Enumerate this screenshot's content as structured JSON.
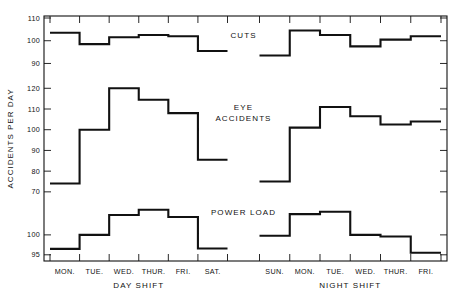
{
  "chart_data": {
    "type": "line",
    "title": "",
    "subtitle": "",
    "xlabel": "",
    "ylabel": "ACCIDENTS PER DAY",
    "grid": false,
    "legend_position": "inline-annotation",
    "panel_groups": [
      {
        "name": "DAY SHIFT",
        "categories": [
          "MON.",
          "TUE.",
          "WED.",
          "THUR.",
          "FRI.",
          "SAT."
        ]
      },
      {
        "name": "NIGHT SHIFT",
        "categories": [
          "SUN.",
          "MON.",
          "TUE.",
          "WED.",
          "THUR.",
          "FRI."
        ]
      }
    ],
    "panels": [
      {
        "name": "CUTS",
        "label": "CUTS",
        "ylim": [
          88,
          110
        ],
        "yticks": [
          90,
          100,
          110
        ],
        "ytick_labels": [
          "90",
          "100",
          "110"
        ],
        "series": [
          {
            "name": "DAY SHIFT",
            "categories": [
              "MON.",
              "TUE.",
              "WED.",
              "THUR.",
              "FRI.",
              "SAT."
            ],
            "values": [
              103.5,
              98.5,
              101.5,
              102.5,
              102.0,
              95.5
            ]
          },
          {
            "name": "NIGHT SHIFT",
            "categories": [
              "SUN.",
              "MON.",
              "TUE.",
              "WED.",
              "THUR.",
              "FRI."
            ],
            "values": [
              93.5,
              104.5,
              102.5,
              97.5,
              100.5,
              102.0
            ]
          }
        ]
      },
      {
        "name": "EYE ACCIDENTS",
        "label": "EYE\nACCIDENTS",
        "label_line1": "EYE",
        "label_line2": "ACCIDENTS",
        "ylim": [
          68,
          124
        ],
        "yticks": [
          70,
          80,
          90,
          100,
          110,
          120
        ],
        "ytick_labels": [
          "70",
          "80",
          "90",
          "100",
          "110",
          "120"
        ],
        "series": [
          {
            "name": "DAY SHIFT",
            "categories": [
              "MON.",
              "TUE.",
              "WED.",
              "THUR.",
              "FRI.",
              "SAT."
            ],
            "values": [
              74.0,
              100.0,
              120.0,
              114.5,
              108.0,
              85.5
            ]
          },
          {
            "name": "NIGHT SHIFT",
            "categories": [
              "SUN.",
              "MON.",
              "TUE.",
              "WED.",
              "THUR.",
              "FRI."
            ],
            "values": [
              75.0,
              101.0,
              111.0,
              106.5,
              102.5,
              104.0
            ]
          }
        ]
      },
      {
        "name": "POWER LOAD",
        "label": "POWER LOAD",
        "ylim": [
          94.2,
          107.5
        ],
        "yticks": [
          95,
          100
        ],
        "ytick_labels": [
          "95",
          "100"
        ],
        "series": [
          {
            "name": "DAY SHIFT",
            "categories": [
              "MON.",
              "TUE.",
              "WED.",
              "THUR.",
              "FRI.",
              "SAT."
            ],
            "values": [
              96.5,
              100.0,
              105.0,
              106.3,
              104.5,
              96.6
            ]
          },
          {
            "name": "NIGHT SHIFT",
            "categories": [
              "SUN.",
              "MON.",
              "TUE.",
              "WED.",
              "THUR.",
              "FRI."
            ],
            "values": [
              99.8,
              105.2,
              105.8,
              100.0,
              99.6,
              95.5
            ]
          }
        ]
      }
    ],
    "colors": {
      "line": "#111111",
      "axis": "#111111",
      "background": "#ffffff"
    }
  }
}
